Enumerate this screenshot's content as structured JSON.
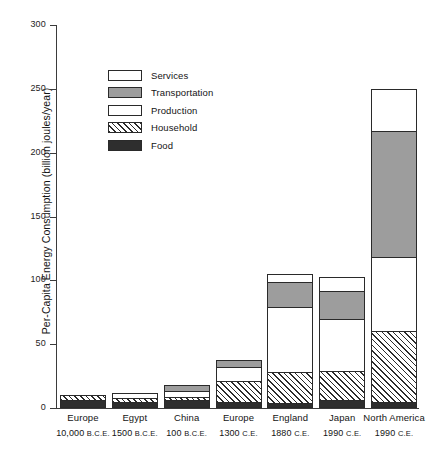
{
  "chart_data": {
    "type": "bar",
    "subtype": "stacked-bar",
    "title": "",
    "xlabel": "",
    "ylabel": "Per-Capita Energy Consumption (billion joules/year)",
    "ylim": [
      0,
      300
    ],
    "ytick_values": [
      0,
      50,
      100,
      150,
      200,
      250,
      300
    ],
    "ytick_labels": [
      "0",
      "50",
      "100",
      "150",
      "200",
      "250",
      "300"
    ],
    "grid": false,
    "legend_position": "inside-upper-left",
    "categories": [
      "Europe 10,000 B.C.E.",
      "Egypt 1500 B.C.E.",
      "China 100 B.C.E.",
      "Europe 1300 C.E.",
      "England 1880 C.E.",
      "Japan 1990 C.E.",
      "North America 1990 C.E."
    ],
    "category_lines": [
      {
        "place": "Europe",
        "era_number": "10,000",
        "era_suffix": "B.C.E."
      },
      {
        "place": "Egypt",
        "era_number": "1500",
        "era_suffix": "B.C.E."
      },
      {
        "place": "China",
        "era_number": "100",
        "era_suffix": "B.C.E."
      },
      {
        "place": "Europe",
        "era_number": "1300",
        "era_suffix": "C.E."
      },
      {
        "place": "England",
        "era_number": "1880",
        "era_suffix": "C.E."
      },
      {
        "place": "Japan",
        "era_number": "1990",
        "era_suffix": "C.E."
      },
      {
        "place": "North America",
        "era_number": "1990",
        "era_suffix": "C.E."
      }
    ],
    "stack_order_bottom_to_top": [
      "Food",
      "Household",
      "Production",
      "Transportation",
      "Services"
    ],
    "series": [
      {
        "name": "Food",
        "pattern": "solid-dark",
        "color": "#2e2e2e",
        "values": [
          6,
          5,
          6,
          5,
          4,
          6,
          5
        ]
      },
      {
        "name": "Household",
        "pattern": "diagonal-hatch",
        "color": "#ffffff",
        "values": [
          4,
          3,
          3,
          16,
          24,
          23,
          55
        ]
      },
      {
        "name": "Production",
        "pattern": "white",
        "color": "#ffffff",
        "values": [
          0,
          4,
          4,
          11,
          51,
          41,
          58
        ]
      },
      {
        "name": "Transportation",
        "pattern": "solid-gray",
        "color": "#9d9d9d",
        "values": [
          0,
          0,
          5,
          6,
          20,
          22,
          99
        ]
      },
      {
        "name": "Services",
        "pattern": "stipple",
        "color": "#ffffff",
        "values": [
          0,
          0,
          0,
          0,
          6,
          11,
          33
        ]
      }
    ],
    "totals": [
      10,
      12,
      18,
      38,
      105,
      103,
      250
    ]
  },
  "legend": {
    "items": [
      {
        "label": "Services"
      },
      {
        "label": "Transportation"
      },
      {
        "label": "Production"
      },
      {
        "label": "Household"
      },
      {
        "label": "Food"
      }
    ]
  }
}
